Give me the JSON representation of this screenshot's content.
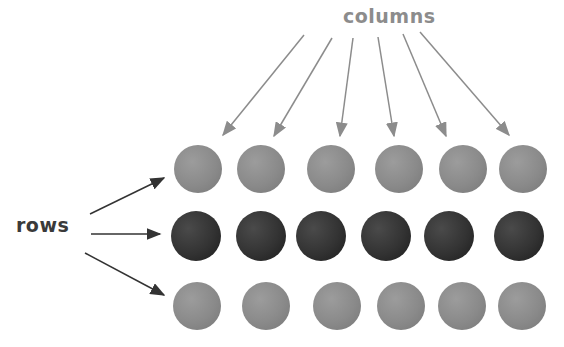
{
  "labels": {
    "columns": "columns",
    "rows": "rows"
  },
  "grid": {
    "rows": 3,
    "columns": 6,
    "row_shades": [
      "light",
      "dark",
      "light"
    ]
  },
  "colors": {
    "light_ball": "#8a8a8a",
    "dark_ball": "#333333",
    "columns_arrow": "#8c8c8c",
    "rows_arrow": "#333333"
  }
}
